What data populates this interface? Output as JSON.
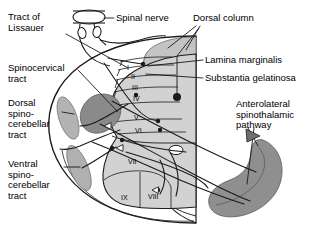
{
  "figure": {
    "type": "anatomical-cross-section"
  },
  "colors": {
    "outline": "#1a1a1a",
    "background": "#ffffff",
    "gray_matter": "#c9c9c9",
    "dorsal_column": "#c4c4c4",
    "spinocervical_tract": "#8a8a8a",
    "dorsal_spinocerebellar": "#b3b3b3",
    "ventral_spinocerebellar": "#b0b0b0",
    "anterolateral_tract": "#8f8f8f",
    "text": "#000000"
  },
  "labels": {
    "tract_of_lissauer": {
      "lines": [
        "Tract of",
        "Lissauer"
      ],
      "x": 8,
      "y": 12
    },
    "spinocervical_tract": {
      "lines": [
        "Spinocervical",
        "tract"
      ],
      "x": 8,
      "y": 63
    },
    "dorsal_spinocerebellar": {
      "lines": [
        "Dorsal",
        "spino-",
        "cerebellar",
        "tract"
      ],
      "x": 8,
      "y": 98
    },
    "ventral_spinocerebellar": {
      "lines": [
        "Ventral",
        "spino-",
        "cerebellar",
        "tract"
      ],
      "x": 8,
      "y": 159
    },
    "spinal_nerve": {
      "lines": [
        "Spinal nerve"
      ],
      "x": 116,
      "y": 13
    },
    "dorsal_column": {
      "lines": [
        "Dorsal column"
      ],
      "x": 193,
      "y": 13
    },
    "lamina_marginalis": {
      "lines": [
        "Lamina marginalis"
      ],
      "x": 205,
      "y": 55
    },
    "substantia_gelatinosa": {
      "lines": [
        "Substantia gelatinosa"
      ],
      "x": 205,
      "y": 73
    },
    "anterolateral_pathway": {
      "lines": [
        "Anterolateral",
        "spinothalamic",
        "pathway"
      ],
      "x": 236,
      "y": 99
    }
  },
  "laminae": [
    {
      "name": "I",
      "x": 127,
      "y": 64
    },
    {
      "name": "II",
      "x": 131,
      "y": 73
    },
    {
      "name": "III",
      "x": 132,
      "y": 84
    },
    {
      "name": "IV",
      "x": 133,
      "y": 95
    },
    {
      "name": "V",
      "x": 134,
      "y": 114
    },
    {
      "name": "VI",
      "x": 135,
      "y": 127
    },
    {
      "name": "VII",
      "x": 128,
      "y": 158
    },
    {
      "name": "VIII",
      "x": 148,
      "y": 193
    },
    {
      "name": "IX",
      "x": 121,
      "y": 194
    }
  ]
}
